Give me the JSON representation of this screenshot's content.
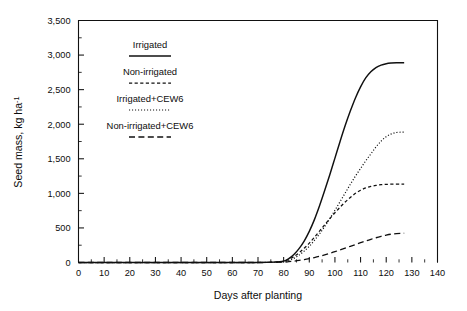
{
  "chart_data": {
    "type": "line",
    "title": "",
    "xlabel": "Days after planting",
    "ylabel": "Seed mass, kg ha-1",
    "ylabel_base": "Seed mass, kg ha",
    "ylabel_sup": "-1",
    "xlim": [
      0,
      140
    ],
    "ylim": [
      0,
      3500
    ],
    "x_major_step": 10,
    "x_minor_step": 5,
    "y_major_step": 500,
    "y_minor_step": 250,
    "grid": false,
    "legend_position": "upper-left-inside",
    "x_ticklabels": [
      "0",
      "10",
      "20",
      "30",
      "40",
      "50",
      "60",
      "70",
      "80",
      "90",
      "100",
      "110",
      "120",
      "130",
      "140"
    ],
    "y_ticklabels": [
      "0",
      "500",
      "1,000",
      "1,500",
      "2,000",
      "2,500",
      "3,000",
      "3,500"
    ],
    "series": [
      {
        "name": "Irrigated",
        "linestyle": "solid",
        "dasharray": "",
        "stroke_width": 1.45,
        "x": [
          0,
          60,
          70,
          76,
          80,
          82,
          84,
          86,
          88,
          90,
          92,
          94,
          96,
          98,
          100,
          102,
          104,
          106,
          108,
          110,
          112,
          114,
          116,
          118,
          120,
          122,
          124,
          126,
          127
        ],
        "y": [
          0,
          0,
          0,
          5,
          20,
          55,
          115,
          200,
          310,
          450,
          620,
          820,
          1040,
          1270,
          1510,
          1750,
          1980,
          2190,
          2380,
          2540,
          2670,
          2760,
          2820,
          2855,
          2875,
          2885,
          2890,
          2890,
          2890
        ]
      },
      {
        "name": "Non-irrigated",
        "linestyle": "short-dash",
        "dasharray": "3.2,2.4",
        "stroke_width": 1.25,
        "x": [
          0,
          60,
          70,
          76,
          80,
          82,
          84,
          86,
          88,
          90,
          92,
          94,
          96,
          98,
          100,
          102,
          104,
          106,
          108,
          110,
          112,
          114,
          116,
          118,
          120,
          122,
          124,
          126,
          127
        ],
        "y": [
          0,
          0,
          0,
          5,
          18,
          45,
          85,
          140,
          205,
          280,
          365,
          455,
          545,
          635,
          720,
          800,
          875,
          940,
          1000,
          1045,
          1078,
          1100,
          1115,
          1125,
          1130,
          1133,
          1135,
          1135,
          1135
        ]
      },
      {
        "name": "Irrigated+CEW6",
        "linestyle": "dotted",
        "dasharray": "1.1,1.9",
        "stroke_width": 1.2,
        "x": [
          0,
          60,
          70,
          76,
          80,
          82,
          84,
          86,
          88,
          90,
          92,
          94,
          96,
          98,
          100,
          102,
          104,
          106,
          108,
          110,
          112,
          114,
          116,
          118,
          120,
          122,
          124,
          126,
          127
        ],
        "y": [
          0,
          0,
          0,
          2,
          10,
          28,
          60,
          105,
          165,
          235,
          320,
          415,
          520,
          635,
          755,
          880,
          1005,
          1130,
          1250,
          1360,
          1470,
          1570,
          1670,
          1755,
          1820,
          1860,
          1880,
          1885,
          1885
        ]
      },
      {
        "name": "Non-irrigated+CEW6",
        "linestyle": "long-dash",
        "dasharray": "6,3.4",
        "stroke_width": 1.3,
        "x": [
          0,
          60,
          70,
          76,
          80,
          82,
          84,
          86,
          88,
          90,
          92,
          94,
          96,
          98,
          100,
          102,
          104,
          106,
          108,
          110,
          112,
          114,
          116,
          118,
          120,
          122,
          124,
          126,
          127
        ],
        "y": [
          0,
          0,
          0,
          2,
          6,
          12,
          20,
          30,
          42,
          56,
          72,
          90,
          110,
          132,
          156,
          182,
          208,
          234,
          260,
          286,
          312,
          336,
          358,
          378,
          396,
          410,
          418,
          422,
          423
        ]
      }
    ]
  },
  "legend": {
    "entries": [
      {
        "label": "Irrigated",
        "linestyle": "solid"
      },
      {
        "label": "Non-irrigated",
        "linestyle": "short-dash"
      },
      {
        "label": "Irrigated+CEW6",
        "linestyle": "dotted"
      },
      {
        "label": "Non-irrigated+CEW6",
        "linestyle": "long-dash"
      }
    ]
  },
  "colors": {
    "ink": "#101010",
    "background": "#ffffff"
  }
}
